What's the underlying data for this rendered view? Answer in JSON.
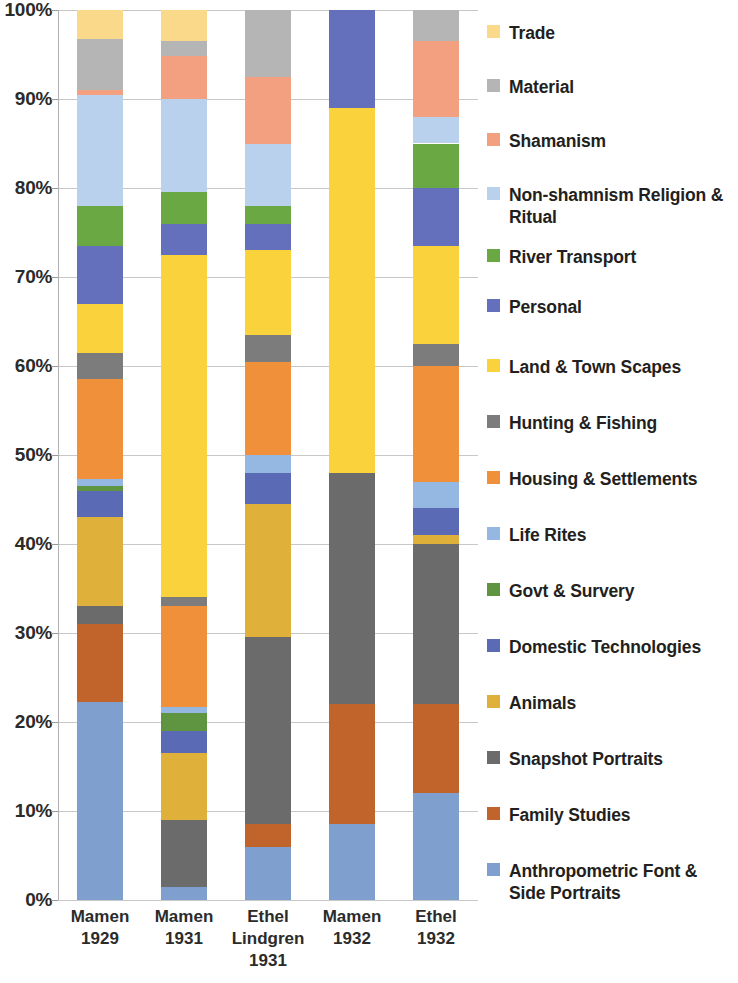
{
  "chart_data": {
    "type": "bar",
    "subtype": "stacked-percentage",
    "title": "",
    "xlabel": "",
    "ylabel": "",
    "ylim": [
      0,
      100
    ],
    "grid": true,
    "legend_position": "right",
    "y_ticks": [
      "0%",
      "10%",
      "20%",
      "30%",
      "40%",
      "50%",
      "60%",
      "70%",
      "80%",
      "90%",
      "100%"
    ],
    "y_tick_values": [
      0,
      10,
      20,
      30,
      40,
      50,
      60,
      70,
      80,
      90,
      100
    ],
    "categories": [
      "Mamen\n1929",
      "Mamen\n1931",
      "Ethel\nLindgren\n1931",
      "Mamen\n1932",
      "Ethel\n1932"
    ],
    "category_labels": [
      [
        "Mamen",
        "1929"
      ],
      [
        "Mamen",
        "1931"
      ],
      [
        "Ethel",
        "Lindgren",
        "1931"
      ],
      [
        "Mamen",
        "1932"
      ],
      [
        "Ethel",
        "1932"
      ]
    ],
    "series": [
      {
        "name": "Anthropometric Font & Side Portraits",
        "color": "#7f9fce",
        "values": [
          22.3,
          1.5,
          6.0,
          8.5,
          12.0
        ]
      },
      {
        "name": "Family Studies",
        "color": "#c0642b",
        "values": [
          8.7,
          0.0,
          2.5,
          13.5,
          10.0
        ]
      },
      {
        "name": "Snapshot Portraits",
        "color": "#6b6b6b",
        "values": [
          2.0,
          7.5,
          21.0,
          26.0,
          18.0
        ]
      },
      {
        "name": "Animals",
        "color": "#e0b13a",
        "values": [
          10.0,
          7.5,
          15.0,
          0.0,
          1.0
        ]
      },
      {
        "name": "Domestic Technologies",
        "color": "#5b6ab5",
        "values": [
          3.0,
          2.5,
          3.5,
          0.0,
          3.0
        ]
      },
      {
        "name": "Govt & Survery",
        "color": "#5f9440",
        "values": [
          0.5,
          2.0,
          0.0,
          0.0,
          0.0
        ]
      },
      {
        "name": "Life Rites",
        "color": "#94b8e2",
        "values": [
          0.8,
          0.7,
          2.0,
          0.0,
          3.0
        ]
      },
      {
        "name": "Housing & Settlements",
        "color": "#f0903a",
        "values": [
          11.2,
          11.3,
          10.5,
          0.0,
          13.0
        ]
      },
      {
        "name": "Hunting & Fishing",
        "color": "#7c7c7c",
        "values": [
          3.0,
          1.0,
          3.0,
          0.0,
          2.5
        ]
      },
      {
        "name": "Land & Town Scapes",
        "color": "#fad23c",
        "values": [
          5.5,
          38.5,
          9.5,
          41.0,
          11.0
        ]
      },
      {
        "name": "Personal",
        "color": "#6570bd",
        "values": [
          6.5,
          3.5,
          3.0,
          11.0,
          6.5
        ]
      },
      {
        "name": "River Transport",
        "color": "#6aa844",
        "values": [
          4.5,
          3.5,
          2.0,
          0.0,
          5.0
        ]
      },
      {
        "name": "Non-shamnism Religion & Ritual",
        "color": "#b9d1ed",
        "values": [
          12.5,
          10.5,
          7.0,
          0.0,
          3.0
        ]
      },
      {
        "name": "Shamanism",
        "color": "#f2a07f",
        "values": [
          0.5,
          4.8,
          7.5,
          0.0,
          8.5
        ]
      },
      {
        "name": "Material",
        "color": "#b5b5b5",
        "values": [
          5.7,
          1.7,
          7.5,
          0.0,
          3.5
        ]
      },
      {
        "name": "Trade",
        "color": "#fbd98a",
        "values": [
          3.3,
          3.5,
          0.0,
          0.0,
          0.0
        ]
      }
    ],
    "legend_entries": [
      {
        "label": "Trade",
        "color": "#fbd98a"
      },
      {
        "label": "Material",
        "color": "#b5b5b5"
      },
      {
        "label": "Shamanism",
        "color": "#f2a07f"
      },
      {
        "label": "Non-shamnism Religion & Ritual",
        "color": "#b9d1ed"
      },
      {
        "label": "River Transport",
        "color": "#6aa844"
      },
      {
        "label": "Personal",
        "color": "#6570bd"
      },
      {
        "label": "Land & Town Scapes",
        "color": "#fad23c"
      },
      {
        "label": "Hunting & Fishing",
        "color": "#7c7c7c"
      },
      {
        "label": "Housing & Settlements",
        "color": "#f0903a"
      },
      {
        "label": "Life Rites",
        "color": "#94b8e2"
      },
      {
        "label": "Govt & Survery",
        "color": "#5f9440"
      },
      {
        "label": "Domestic Technologies",
        "color": "#5b6ab5"
      },
      {
        "label": "Animals",
        "color": "#e0b13a"
      },
      {
        "label": "Snapshot Portraits",
        "color": "#6b6b6b"
      },
      {
        "label": "Family Studies",
        "color": "#c0642b"
      },
      {
        "label": "Anthropometric Font & Side Portraits",
        "color": "#7f9fce"
      }
    ]
  }
}
